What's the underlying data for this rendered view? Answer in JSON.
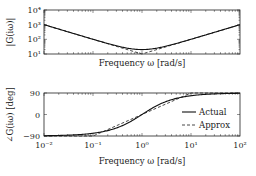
{
  "chart_data": [
    {
      "type": "line",
      "name": "magnitude",
      "xscale": "log",
      "yscale": "log",
      "xlim": [
        0.01,
        100
      ],
      "ylim": [
        10,
        10000
      ],
      "xlabel": "Frequency ω [rad/s]",
      "ylabel": "|G(iω)|",
      "yticks": [
        10,
        100,
        1000,
        10000
      ],
      "ytick_labels": [
        "10¹",
        "10²",
        "10³",
        "10⁴"
      ],
      "grid": false,
      "series": [
        {
          "name": "Actual",
          "style": "solid",
          "x": [
            0.01,
            0.03,
            0.1,
            0.3,
            1,
            3,
            10,
            30,
            100
          ],
          "y": [
            1000,
            334,
            101,
            36.3,
            20,
            36.3,
            101,
            334,
            1000
          ]
        },
        {
          "name": "Approx",
          "style": "dashed",
          "x": [
            0.01,
            1,
            100
          ],
          "y": [
            1000,
            10,
            1000
          ]
        }
      ]
    },
    {
      "type": "line",
      "name": "phase",
      "xscale": "log",
      "xlim": [
        0.01,
        100
      ],
      "ylim": [
        -90,
        90
      ],
      "xlabel": "Frequency ω [rad/s]",
      "ylabel": "∠G(iω) [deg]",
      "xticks": [
        0.01,
        0.1,
        1,
        10,
        100
      ],
      "xtick_labels": [
        "10⁻²",
        "10⁻¹",
        "10⁰",
        "10¹",
        "10²"
      ],
      "yticks": [
        -90,
        0,
        90
      ],
      "ytick_labels": [
        "−90",
        "0",
        "90"
      ],
      "grid": false,
      "legend": {
        "position": "right",
        "entries": [
          "Actual",
          "Approx"
        ]
      },
      "series": [
        {
          "name": "Actual",
          "style": "solid",
          "x": [
            0.01,
            0.03,
            0.1,
            0.3,
            1,
            3,
            10,
            30,
            100
          ],
          "y": [
            -88.9,
            -86.6,
            -78.6,
            -56.6,
            0,
            56.6,
            78.6,
            86.6,
            88.9
          ]
        },
        {
          "name": "Approx",
          "style": "dashed",
          "x": [
            0.01,
            0.1,
            10,
            100
          ],
          "y": [
            -90,
            -90,
            90,
            90
          ]
        }
      ]
    }
  ]
}
